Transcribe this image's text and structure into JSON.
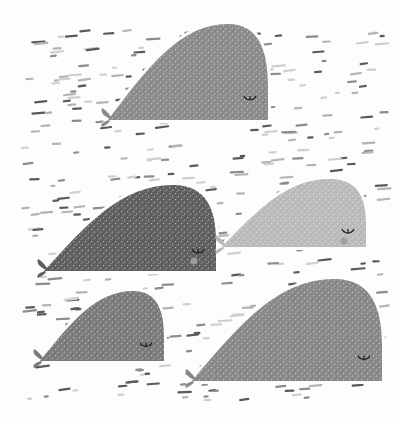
{
  "illustration": {
    "title": "Sleeping whales pattern",
    "background": "#fdfdfd",
    "dash_colors": [
      "#5a5a5a",
      "#8c8c8c",
      "#b4b4b4",
      "#cfcfcf"
    ],
    "eye_color": "#222222",
    "whales": [
      {
        "name": "whale-top",
        "body_color": "#8a8a8a",
        "cheek": false
      },
      {
        "name": "whale-middle-left",
        "body_color": "#5e5e5e",
        "cheek": true,
        "cheek_color": "#9a9a9a"
      },
      {
        "name": "whale-middle-right",
        "body_color": "#b9b9b9",
        "cheek": true,
        "cheek_color": "#a0a0a0"
      },
      {
        "name": "whale-bottom-left",
        "body_color": "#7a7a7a",
        "cheek": false
      },
      {
        "name": "whale-bottom-right",
        "body_color": "#878787",
        "cheek": false
      }
    ]
  }
}
